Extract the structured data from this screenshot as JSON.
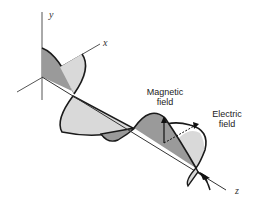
{
  "diagram": {
    "axes": {
      "x": "x",
      "y": "y",
      "z": "z"
    },
    "labels": {
      "magnetic_line1": "Magnetic",
      "magnetic_line2": "field",
      "electric_line1": "Electric",
      "electric_line2": "field"
    },
    "colors": {
      "light_fill": "#d9d9d9",
      "dark_fill": "#9a9a9a",
      "outline": "#1a1a1a",
      "axis": "#444444"
    }
  }
}
